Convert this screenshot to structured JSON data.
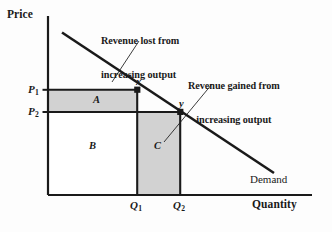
{
  "figure": {
    "type": "economics-diagram",
    "axes": {
      "y_title": "Price",
      "x_title": "Quantity"
    },
    "curve": {
      "label": "Demand",
      "shape": "downward-sloping straight line"
    },
    "price_ticks": [
      {
        "base": "P",
        "sub": "1"
      },
      {
        "base": "P",
        "sub": "2"
      }
    ],
    "quantity_ticks": [
      {
        "base": "Q",
        "sub": "1"
      },
      {
        "base": "Q",
        "sub": "2"
      }
    ],
    "points": [
      {
        "label": "x",
        "price_tick": "P1",
        "quantity_tick": "Q1"
      },
      {
        "label": "y",
        "price_tick": "P2",
        "quantity_tick": "Q2"
      }
    ],
    "regions": [
      {
        "label": "A",
        "shaded": true,
        "fill": "#d2d2d2"
      },
      {
        "label": "B",
        "shaded": false,
        "fill": "#ffffff"
      },
      {
        "label": "C",
        "shaded": true,
        "fill": "#d2d2d2"
      }
    ],
    "annotations": [
      {
        "id": "revenue-lost",
        "line1": "Revenue lost from",
        "line2": "increasing output",
        "points_to": "region-A"
      },
      {
        "id": "revenue-gained",
        "line1": "Revenue gained from",
        "line2": "increasing output",
        "points_to": "region-C"
      }
    ],
    "colors": {
      "ink": "#1a1a1a",
      "shade": "#d2d2d2",
      "background": "#fdfdfd"
    }
  }
}
